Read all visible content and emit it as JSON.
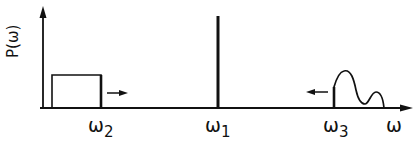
{
  "diagram": {
    "y_axis_label": "P(ω)",
    "x_axis_label": "ω",
    "markers": [
      {
        "symbol": "ω",
        "subscript": "2",
        "x": 101
      },
      {
        "symbol": "ω",
        "subscript": "1",
        "x": 218
      },
      {
        "symbol": "ω",
        "subscript": "3",
        "x": 334
      }
    ],
    "elements": {
      "rect_pulse": {
        "x_start": 52,
        "x_end": 101,
        "height_top": 75,
        "arrow_direction": "right"
      },
      "spike": {
        "x": 218,
        "top": 16
      },
      "curve": {
        "x_start": 334,
        "x_end": 385,
        "arrow_direction": "left"
      }
    },
    "colors": {
      "ink": "#111111",
      "background": "#ffffff"
    }
  }
}
